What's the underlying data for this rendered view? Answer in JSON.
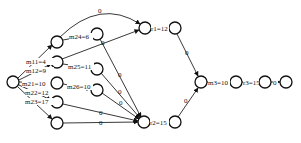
{
  "diagram": {
    "type": "directed-graph",
    "background": "#ffffff",
    "stroke_color": "#111111",
    "nodes": [
      {
        "id": "S",
        "x": 13,
        "y": 82
      },
      {
        "id": "A",
        "x": 57,
        "y": 42
      },
      {
        "id": "B",
        "x": 57,
        "y": 62
      },
      {
        "id": "C",
        "x": 57,
        "y": 83
      },
      {
        "id": "D",
        "x": 57,
        "y": 102
      },
      {
        "id": "E",
        "x": 57,
        "y": 123
      },
      {
        "id": "N24",
        "x": 97,
        "y": 34
      },
      {
        "id": "N25",
        "x": 97,
        "y": 69
      },
      {
        "id": "N26",
        "x": 97,
        "y": 90
      },
      {
        "id": "R1a",
        "x": 145,
        "y": 28
      },
      {
        "id": "R1b",
        "x": 175,
        "y": 28
      },
      {
        "id": "H",
        "x": 144,
        "y": 122
      },
      {
        "id": "R2b",
        "x": 175,
        "y": 122
      },
      {
        "id": "M3a",
        "x": 201,
        "y": 82
      },
      {
        "id": "M3b",
        "x": 236,
        "y": 82
      },
      {
        "id": "R3b",
        "x": 265,
        "y": 82
      },
      {
        "id": "T",
        "x": 286,
        "y": 82
      }
    ],
    "labels": {
      "m11": "m11=4",
      "m12": "m12=9",
      "m21": "m21=10",
      "m22": "m22=12",
      "m23": "m23=17",
      "m24": "m24=6",
      "m25": "m25=11",
      "m26": "m26=10",
      "r1": "r1=12",
      "r2": "r2=15",
      "m3": "m3=10",
      "r3": "r3=15",
      "zero": "0"
    }
  }
}
